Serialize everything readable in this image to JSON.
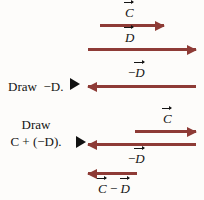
{
  "figure": {
    "background_color": "#fdfcfa",
    "arrow_color": "#8e3b36",
    "text_color": "#141414",
    "cue_marker_color": "#111111"
  },
  "rows": {
    "given_c": {
      "label": "C",
      "label_sign": "",
      "direction": "right",
      "arrow_start_x": 100,
      "arrow_end_x": 164,
      "arrow_y": 24
    },
    "given_d": {
      "label": "D",
      "label_sign": "",
      "direction": "right",
      "arrow_start_x": 88,
      "arrow_end_x": 196,
      "arrow_y": 48
    },
    "neg_d": {
      "label": "D",
      "label_sign": "−",
      "direction": "left",
      "arrow_start_x": 88,
      "arrow_end_x": 196,
      "arrow_y": 85
    },
    "sum_c": {
      "label": "C",
      "label_sign": "",
      "direction": "right",
      "arrow_start_x": 135,
      "arrow_end_x": 196,
      "arrow_y": 130
    },
    "sum_neg_d": {
      "label": "D",
      "label_sign": "−",
      "direction": "left",
      "arrow_start_x": 88,
      "arrow_end_x": 196,
      "arrow_y": 143
    },
    "resultant": {
      "label_first": "C",
      "label_operator": "−",
      "label_second": "D",
      "direction": "left",
      "arrow_start_x": 88,
      "arrow_end_x": 137,
      "arrow_y": 172
    }
  },
  "instructions": {
    "first": {
      "word_draw": "Draw",
      "sign": "−",
      "vector": "D",
      "period": "."
    },
    "second": {
      "word_draw": "Draw",
      "first_vector": "C",
      "operator": "+",
      "open_paren": "(",
      "sign": "−",
      "second_vector": "D",
      "close_paren": ")",
      "period": "."
    }
  }
}
